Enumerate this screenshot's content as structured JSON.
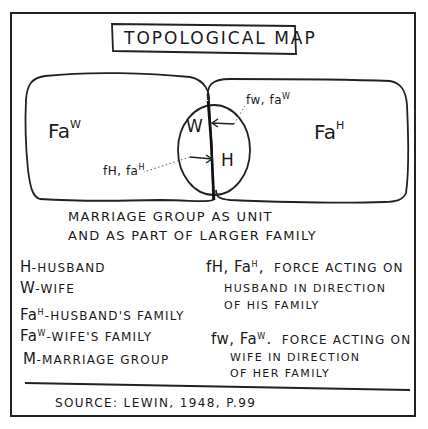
{
  "diagram": {
    "title": "TOPOLOGICAL MAP",
    "regions": {
      "wife_family": {
        "label": "Fa",
        "superscript": "W"
      },
      "husband_family": {
        "label": "Fa",
        "superscript": "H"
      },
      "marriage_group": {
        "wife_node": "W",
        "husband_node": "H"
      }
    },
    "forces": {
      "wife_force": {
        "label": "fw, fa",
        "superscript": "W"
      },
      "husband_force": {
        "label": "fH, fa",
        "superscript": "H"
      }
    },
    "caption": {
      "line1": "MARRIAGE GROUP AS UNIT",
      "line2": "AND AS PART OF LARGER FAMILY"
    },
    "legend": {
      "left": [
        {
          "key": "H",
          "sup": "",
          "text": "-HUSBAND"
        },
        {
          "key": "W",
          "sup": "",
          "text": "-WIFE"
        },
        {
          "key": "Fa",
          "sup": "H",
          "text": "-HUSBAND'S FAMILY"
        },
        {
          "key": "Fa",
          "sup": "W",
          "text": "-WIFE'S FAMILY"
        },
        {
          "key": "M",
          "sup": "",
          "text": "-MARRIAGE GROUP"
        }
      ],
      "right": [
        {
          "key": "fH, Fa",
          "sup": "H",
          "punct": ",",
          "line1": "FORCE ACTING ON",
          "line2": "HUSBAND IN DIRECTION",
          "line3": "OF HIS FAMILY"
        },
        {
          "key": "fw, Fa",
          "sup": "W",
          "punct": ".",
          "line1": "FORCE ACTING ON",
          "line2": "WIFE IN DIRECTION",
          "line3": "OF HER FAMILY"
        }
      ]
    },
    "source": "SOURCE: LEWIN, 1948, P.99"
  }
}
